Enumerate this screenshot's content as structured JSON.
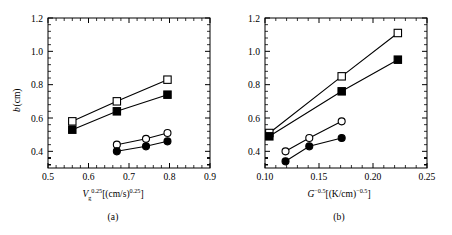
{
  "figure": {
    "background_color": "#ffffff",
    "line_color": "#000000",
    "marker_fill_open": "#ffffff",
    "marker_fill_closed": "#000000"
  },
  "panels": [
    {
      "id": "a",
      "caption": "(a)",
      "xlabel_parts": {
        "symbol": "V",
        "subscript": "g",
        "exponent": "0.25",
        "unit_open": "[(cm/s)",
        "unit_exponent": "0.25",
        "unit_close": "]"
      },
      "ylabel_parts": {
        "symbol": "b",
        "unit": "(cm)"
      },
      "xticks": [
        "0.5",
        "0.6",
        "0.7",
        "0.8",
        "0.9"
      ],
      "xtick_values": [
        0.5,
        0.6,
        0.7,
        0.8,
        0.9
      ],
      "yticks": [
        "0.4",
        "0.6",
        "0.8",
        "1.0",
        "1.2"
      ],
      "ytick_values": [
        0.4,
        0.6,
        0.8,
        1.0,
        1.2
      ]
    },
    {
      "id": "b",
      "caption": "(b)",
      "xlabel_parts": {
        "symbol": "G",
        "subscript": "",
        "exponent": "−0.5",
        "unit_open": "[(K/cm)",
        "unit_exponent": "−0.5",
        "unit_close": "]"
      },
      "ylabel_parts": {
        "symbol": "",
        "unit": ""
      },
      "xticks": [
        "0.10",
        "0.15",
        "0.20",
        "0.25"
      ],
      "xtick_values": [
        0.1,
        0.15,
        0.2,
        0.25
      ],
      "yticks": [
        "0.4",
        "0.6",
        "0.8",
        "1.0",
        "1.2"
      ],
      "ytick_values": [
        0.4,
        0.6,
        0.8,
        1.0,
        1.2
      ]
    }
  ],
  "chart_data": [
    {
      "type": "line",
      "panel": "a",
      "title": "",
      "xlabel": "V_g^0.25 [(cm/s)^0.25]",
      "ylabel": "b (cm)",
      "xlim": [
        0.5,
        0.9
      ],
      "ylim": [
        0.3,
        1.2
      ],
      "grid": false,
      "legend": "none",
      "minor_ticks_x": 4,
      "minor_ticks_y": 4,
      "series": [
        {
          "name": "open-square",
          "marker": "open-square",
          "x": [
            0.56,
            0.67,
            0.795
          ],
          "y": [
            0.58,
            0.7,
            0.83
          ]
        },
        {
          "name": "filled-square",
          "marker": "filled-square",
          "x": [
            0.56,
            0.67,
            0.795
          ],
          "y": [
            0.53,
            0.64,
            0.74
          ]
        },
        {
          "name": "open-circle",
          "marker": "open-circle",
          "x": [
            0.67,
            0.742,
            0.795
          ],
          "y": [
            0.44,
            0.475,
            0.51
          ]
        },
        {
          "name": "filled-circle",
          "marker": "filled-circle",
          "x": [
            0.67,
            0.742,
            0.795
          ],
          "y": [
            0.4,
            0.43,
            0.46
          ]
        }
      ]
    },
    {
      "type": "line",
      "panel": "b",
      "title": "",
      "xlabel": "G^-0.5 [(K/cm)^-0.5]",
      "ylabel": "b (cm)",
      "xlim": [
        0.1,
        0.25
      ],
      "ylim": [
        0.3,
        1.2
      ],
      "grid": false,
      "legend": "none",
      "minor_ticks_x": 4,
      "minor_ticks_y": 4,
      "series": [
        {
          "name": "open-square",
          "marker": "open-square",
          "x": [
            0.104,
            0.171,
            0.223
          ],
          "y": [
            0.51,
            0.85,
            1.11
          ]
        },
        {
          "name": "filled-square",
          "marker": "filled-square",
          "x": [
            0.104,
            0.171,
            0.223
          ],
          "y": [
            0.49,
            0.76,
            0.95
          ]
        },
        {
          "name": "open-circle",
          "marker": "open-circle",
          "x": [
            0.119,
            0.141,
            0.171
          ],
          "y": [
            0.4,
            0.48,
            0.58
          ]
        },
        {
          "name": "filled-circle",
          "marker": "filled-circle",
          "x": [
            0.119,
            0.141,
            0.171
          ],
          "y": [
            0.34,
            0.43,
            0.48
          ]
        }
      ]
    }
  ]
}
